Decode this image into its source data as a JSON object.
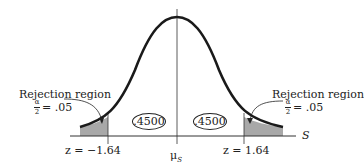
{
  "diagram": {
    "type": "normal-distribution-two-tailed-test",
    "axis_label": "S",
    "center_label": "μ",
    "center_subscript": "S",
    "left_critical": "z = −1.64",
    "right_critical": "z = 1.64",
    "left_area": ".4500",
    "right_area": ".4500",
    "left_region": {
      "title": "Rejection region",
      "alpha_num": "α",
      "alpha_den": "2",
      "alpha_value": "= .05"
    },
    "right_region": {
      "title": "Rejection region",
      "alpha_num": "α",
      "alpha_den": "2",
      "alpha_value": "= .05"
    },
    "colors": {
      "curve": "#1a1a1a",
      "shade": "#a8a8a8",
      "axis": "#333333"
    }
  }
}
